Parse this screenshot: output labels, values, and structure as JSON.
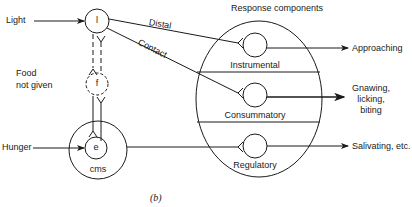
{
  "diagram": {
    "inputs": {
      "light": "Light",
      "food_not_given_line1": "Food",
      "food_not_given_line2": "not given",
      "hunger": "Hunger"
    },
    "nodes": {
      "l": "l",
      "f": "f",
      "e": "e",
      "cms": "cms"
    },
    "pathways": {
      "distal": "Distal",
      "contact": "Contact"
    },
    "response_components": {
      "title": "Response components",
      "instrumental": "Instrumental",
      "consummatory": "Consummatory",
      "regulatory": "Regulatory"
    },
    "outputs": {
      "approaching": "Approaching",
      "gnawing_line1": "Gnawing,",
      "gnawing_line2": "licking,",
      "gnawing_line3": "biting",
      "salivating": "Salivating, etc."
    },
    "caption": "(b)"
  }
}
